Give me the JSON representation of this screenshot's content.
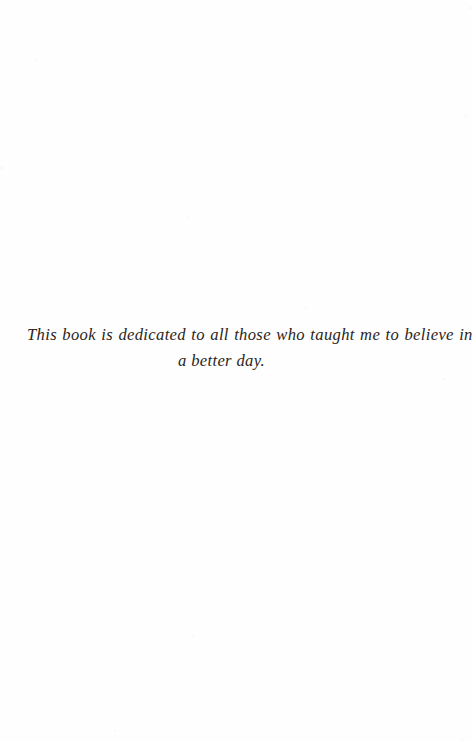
{
  "document": {
    "type": "book-dedication-page",
    "page_width": 473,
    "page_height": 742,
    "background_color": "#fefefe",
    "text_color": "#2a2520"
  },
  "dedication": {
    "full_text": "This book is dedicated to all those who taught me to believe in a better day.",
    "lines": [
      "This book is dedicated to all those who taught me to believe in",
      "a better day."
    ]
  }
}
